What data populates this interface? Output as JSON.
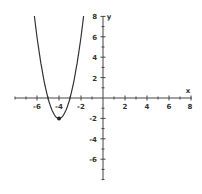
{
  "chart_data": {
    "type": "line",
    "title": "",
    "xlabel": "x",
    "ylabel": "y",
    "xlim": [
      -8,
      8
    ],
    "ylim": [
      -8,
      8
    ],
    "x_ticks": [
      -6,
      -4,
      -2,
      2,
      4,
      6,
      8
    ],
    "y_ticks": [
      8,
      6,
      4,
      2,
      -2,
      -4,
      -6
    ],
    "grid": false,
    "legend": null,
    "series": [
      {
        "name": "parabola",
        "equation": "y = 2(x+4)^2 - 2",
        "coefficient_a": 2,
        "coefficient_a_note": "estimated from curve endpoints near top of frame; x-axis crossings at -5 and -3 not verified",
        "vertex": [
          -4,
          -2
        ],
        "x_range": [
          -6.24,
          -1.76
        ],
        "points": [
          [
            -6.24,
            8
          ],
          [
            -6,
            6
          ],
          [
            -5.5,
            2.5
          ],
          [
            -5,
            0
          ],
          [
            -4.5,
            -1.5
          ],
          [
            -4,
            -2
          ],
          [
            -3.5,
            -1.5
          ],
          [
            -3,
            0
          ],
          [
            -2.5,
            2.5
          ],
          [
            -2,
            6
          ],
          [
            -1.76,
            8
          ]
        ]
      }
    ],
    "annotations": [
      {
        "type": "point",
        "x": -4,
        "y": -2,
        "label": "vertex"
      }
    ]
  },
  "axes": {
    "x_label": "x",
    "y_label": "y",
    "x_tick_labels": [
      "-6",
      "-4",
      "-2",
      "2",
      "4",
      "6",
      "8"
    ],
    "y_tick_labels": [
      "8",
      "6",
      "4",
      "2",
      "-2",
      "-4",
      "-6"
    ]
  },
  "colors": {
    "axis": "#444444",
    "curve": "#333333",
    "label": "#333333",
    "background": "#ffffff"
  }
}
